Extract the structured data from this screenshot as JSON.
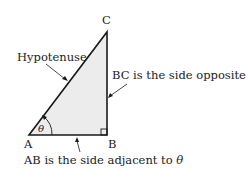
{
  "diagram": {
    "vertices": {
      "A": "A",
      "B": "B",
      "C": "C"
    },
    "angle_symbol": "θ",
    "labels": {
      "hypotenuse": "Hypotenuse",
      "opposite": "BC is the side opposite ",
      "adjacent": "AB is the side adjacent to "
    },
    "colors": {
      "fill": "#ececec",
      "stroke": "#1a1a1a"
    }
  }
}
